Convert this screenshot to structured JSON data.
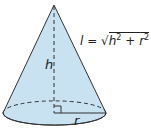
{
  "diagram": {
    "labels": {
      "height": "h",
      "radius": "r"
    },
    "formula": {
      "lhs": "l",
      "equals": "=",
      "sqrt": "√",
      "term1_base": "h",
      "term1_exp": "2",
      "plus": "+",
      "term2_base": "r",
      "term2_exp": "2"
    },
    "colors": {
      "fill": "#c8e2f2",
      "stroke": "#333333"
    }
  }
}
